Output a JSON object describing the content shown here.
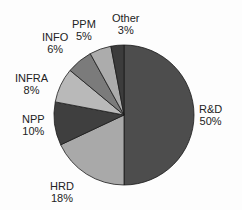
{
  "chart_data": {
    "type": "pie",
    "title": "",
    "categories": [
      "R&D",
      "HRD",
      "NPP",
      "INFRA",
      "INFO",
      "PPM",
      "Other"
    ],
    "values": [
      50,
      18,
      10,
      8,
      6,
      5,
      3
    ],
    "unit": "%",
    "colors": [
      "#4d4d4d",
      "#a9a9a9",
      "#3f3f3f",
      "#b9b9b9",
      "#7b7b7b",
      "#acacac",
      "#3c3c3c"
    ],
    "start_angle": "12 o'clock",
    "direction": "clockwise",
    "legend": "none (direct labels)"
  },
  "labels": [
    {
      "name": "R&D",
      "pct": "50%"
    },
    {
      "name": "HRD",
      "pct": "18%"
    },
    {
      "name": "NPP",
      "pct": "10%"
    },
    {
      "name": "INFRA",
      "pct": "8%"
    },
    {
      "name": "INFO",
      "pct": "6%"
    },
    {
      "name": "PPM",
      "pct": "5%"
    },
    {
      "name": "Other",
      "pct": "3%"
    }
  ]
}
